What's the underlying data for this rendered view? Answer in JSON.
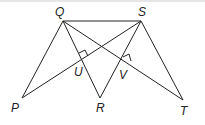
{
  "diagram": {
    "points": {
      "Q": {
        "label": "Q",
        "x": 63,
        "y": 21
      },
      "S": {
        "label": "S",
        "x": 141,
        "y": 21
      },
      "P": {
        "label": "P",
        "x": 22,
        "y": 98
      },
      "R": {
        "label": "R",
        "x": 100,
        "y": 98
      },
      "T": {
        "label": "T",
        "x": 183,
        "y": 100
      },
      "U": {
        "label": "U"
      },
      "V": {
        "label": "V"
      }
    },
    "segments": [
      "QS",
      "QP",
      "QR",
      "QT",
      "SP",
      "SR",
      "ST"
    ],
    "right_angles": [
      "U",
      "V"
    ],
    "line_color": "#222222"
  }
}
